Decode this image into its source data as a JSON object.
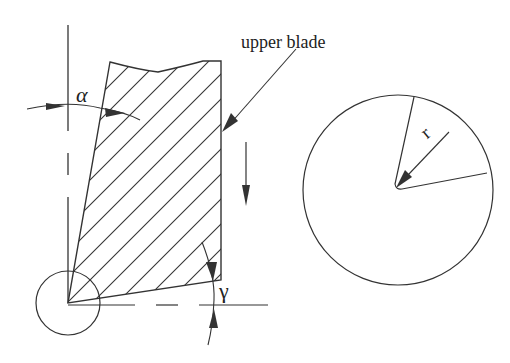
{
  "labels": {
    "upper_blade": "upper blade",
    "alpha": "α",
    "gamma": "γ",
    "radius": "r"
  },
  "colors": {
    "stroke": "#333333",
    "background": "#ffffff"
  },
  "figure": {
    "left_view": {
      "description": "blade cross-section with hatching",
      "angles": [
        "α",
        "γ"
      ],
      "motion_arrow": "down"
    },
    "right_view": {
      "description": "circle with sector and radius r"
    }
  }
}
